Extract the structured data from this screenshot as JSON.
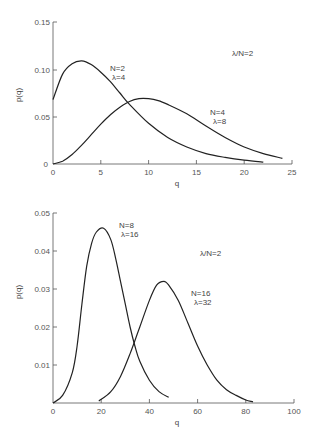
{
  "chart_data": [
    {
      "type": "line",
      "title": "",
      "xlabel": "q",
      "ylabel": "p(q)",
      "xlim": [
        0,
        25
      ],
      "ylim": [
        0,
        0.15
      ],
      "xticks": [
        "0",
        "5",
        "10",
        "15",
        "20",
        "25"
      ],
      "yticks": [
        "0",
        "0.05",
        "0.10",
        "0.15"
      ],
      "grid": false,
      "annotation": "λ/N=2",
      "series": [
        {
          "name": "N=2, λ=4",
          "label_n": "N=2",
          "label_lambda": "λ=4",
          "x": [
            0,
            1,
            2,
            3,
            4,
            5,
            6,
            7,
            8,
            10,
            12,
            14,
            16,
            18,
            20,
            22
          ],
          "values": [
            0.068,
            0.095,
            0.106,
            0.109,
            0.105,
            0.097,
            0.087,
            0.075,
            0.063,
            0.043,
            0.028,
            0.018,
            0.011,
            0.007,
            0.004,
            0.002
          ]
        },
        {
          "name": "N=4, λ=8",
          "label_n": "N=4",
          "label_lambda": "λ=8",
          "x": [
            0,
            1,
            2,
            3,
            4,
            5,
            6,
            7,
            8,
            9,
            10,
            11,
            12,
            14,
            16,
            18,
            20,
            22,
            24
          ],
          "values": [
            0,
            0.003,
            0.01,
            0.02,
            0.031,
            0.042,
            0.052,
            0.06,
            0.066,
            0.069,
            0.069,
            0.067,
            0.063,
            0.053,
            0.04,
            0.028,
            0.018,
            0.011,
            0.006
          ]
        }
      ]
    },
    {
      "type": "line",
      "title": "",
      "xlabel": "q",
      "ylabel": "p(q)",
      "xlim": [
        0,
        100
      ],
      "ylim": [
        0,
        0.05
      ],
      "xticks": [
        "0",
        "20",
        "40",
        "60",
        "80",
        "100"
      ],
      "yticks": [
        "0.01",
        "0.02",
        "0.03",
        "0.04",
        "0.05"
      ],
      "grid": false,
      "annotation": "λ/N=2",
      "series": [
        {
          "name": "N=8, λ=16",
          "label_n": "N=8",
          "label_lambda": "λ=16",
          "x": [
            0,
            4,
            8,
            10,
            12,
            14,
            16,
            18,
            21,
            24,
            26,
            28,
            30,
            32,
            34,
            36,
            40,
            44,
            48
          ],
          "values": [
            0,
            0.002,
            0.008,
            0.015,
            0.026,
            0.036,
            0.042,
            0.045,
            0.046,
            0.043,
            0.038,
            0.032,
            0.026,
            0.02,
            0.015,
            0.011,
            0.006,
            0.003,
            0.0015
          ]
        },
        {
          "name": "N=16, λ=32",
          "label_n": "N=16",
          "label_lambda": "λ=32",
          "x": [
            19,
            24,
            28,
            32,
            36,
            40,
            43,
            46,
            48,
            52,
            56,
            60,
            64,
            68,
            72,
            76,
            80,
            83
          ],
          "values": [
            0.0005,
            0.003,
            0.007,
            0.013,
            0.02,
            0.027,
            0.031,
            0.032,
            0.031,
            0.027,
            0.021,
            0.015,
            0.01,
            0.006,
            0.0035,
            0.002,
            0.0008,
            0.0003
          ]
        }
      ]
    }
  ]
}
